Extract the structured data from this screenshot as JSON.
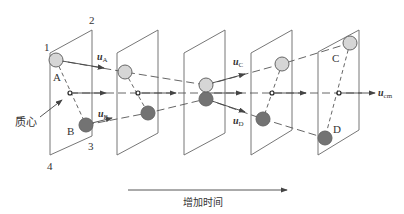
{
  "diagram": {
    "labels": {
      "corner1": "1",
      "corner2": "2",
      "corner3": "3",
      "corner4": "4",
      "particleA": "A",
      "particleB": "B",
      "particleC": "C",
      "particleD": "D",
      "centerOfMass": "质心",
      "timeAxis": "增加时间"
    },
    "velocities": {
      "uA": {
        "symbol": "u",
        "subscript": "A"
      },
      "uB": {
        "symbol": "u",
        "subscript": "B"
      },
      "uC": {
        "symbol": "u",
        "subscript": "C"
      },
      "uD": {
        "symbol": "u",
        "subscript": "D"
      },
      "ucm": {
        "symbol": "u",
        "subscript": "cm"
      }
    },
    "colors": {
      "lightParticle": "#d6d6d6",
      "darkParticle": "#737373",
      "stroke": "#666666"
    }
  }
}
